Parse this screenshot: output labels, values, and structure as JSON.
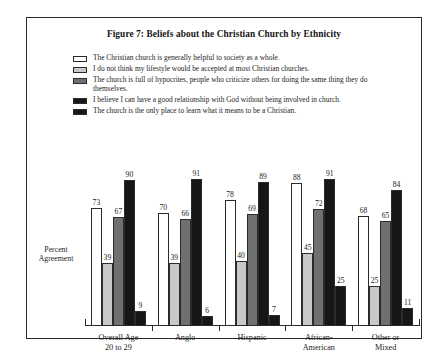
{
  "figure": {
    "title": "Figure 7: Beliefs about the Christian Church by Ethnicity",
    "y_axis_label_line1": "Percent",
    "y_axis_label_line2": "Agreement"
  },
  "legend": {
    "items": [
      {
        "label": "The Christian church is generally helpful to society as a whole.",
        "color": "#ffffff"
      },
      {
        "label": "I do not think my lifestyle would be accepted at most Christian churches.",
        "color": "#c8c8c8"
      },
      {
        "label": "The church is full of hypocrites, people who criticize others for doing the same thing they do themselves.",
        "color": "#707070"
      },
      {
        "label": "I believe I can have a good relationship with God without being involved in church.",
        "color": "#161616"
      },
      {
        "label": "The church is the only place to learn what it means to be a Christian.",
        "color": "#161616"
      }
    ]
  },
  "chart_data": {
    "type": "bar",
    "title": "Figure 7: Beliefs about the Christian Church by Ethnicity",
    "xlabel": "",
    "ylabel": "Percent Agreement",
    "ylim": [
      0,
      100
    ],
    "grid": false,
    "legend_position": "top",
    "categories": [
      "Overall Age 20 to 29",
      "Anglo",
      "Hispanic",
      "African-American",
      "Other or Mixed"
    ],
    "category_lines": [
      [
        "Overall Age",
        "20 to 29"
      ],
      [
        "Anglo",
        ""
      ],
      [
        "Hispanic",
        ""
      ],
      [
        "African-",
        "American"
      ],
      [
        "Other or",
        "Mixed"
      ]
    ],
    "series": [
      {
        "name": "The Christian church is generally helpful to society as a whole.",
        "color": "#ffffff",
        "values": [
          73,
          70,
          78,
          88,
          68
        ]
      },
      {
        "name": "I do not think my lifestyle would be accepted at most Christian churches.",
        "color": "#c8c8c8",
        "values": [
          39,
          39,
          40,
          45,
          25
        ]
      },
      {
        "name": "The church is full of hypocrites, people who criticize others for doing the same thing they do themselves.",
        "color": "#707070",
        "values": [
          67,
          66,
          69,
          72,
          65
        ]
      },
      {
        "name": "I believe I can have a good relationship with God without being involved in church.",
        "color": "#161616",
        "values": [
          90,
          91,
          89,
          91,
          84
        ]
      },
      {
        "name": "The church is the only place to learn what it means to be a Christian.",
        "color": "#161616",
        "values": [
          9,
          6,
          7,
          25,
          11
        ]
      }
    ]
  }
}
